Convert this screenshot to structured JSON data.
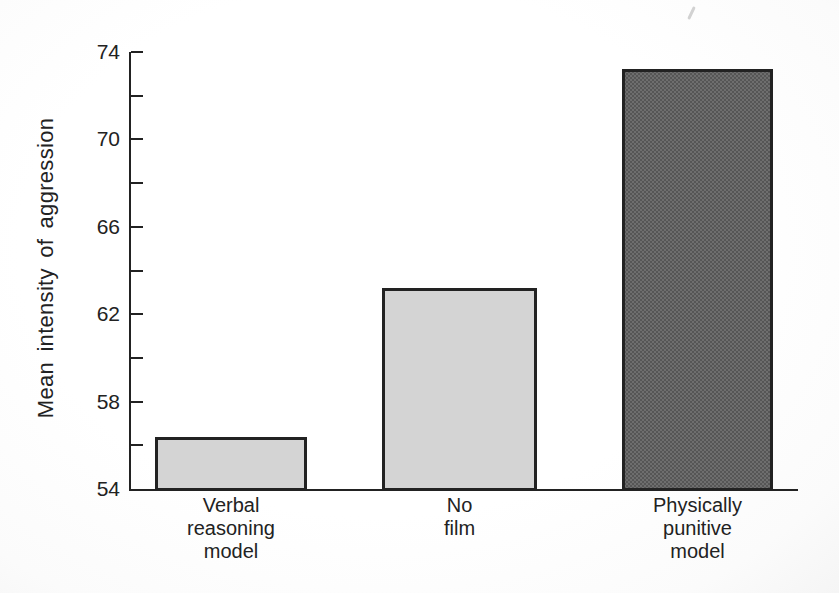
{
  "chart_data": {
    "type": "bar",
    "title": "",
    "xlabel": "",
    "ylabel": "Mean intensity of aggression",
    "categories": [
      "Verbal reasoning model",
      "No film",
      "Physically punitive model"
    ],
    "category_display_lines": [
      [
        "Verbal",
        "reasoning",
        "model"
      ],
      [
        "No",
        "film"
      ],
      [
        "Physically",
        "punitive",
        "model"
      ]
    ],
    "values": [
      56.4,
      63.2,
      73.2
    ],
    "bar_tones": [
      "light",
      "light",
      "dark"
    ],
    "ylim": [
      54,
      74
    ],
    "yticks_labeled": [
      74,
      70,
      66,
      62,
      58,
      54
    ],
    "yticks_minor": [
      72,
      68,
      64,
      60,
      56
    ],
    "grid": false,
    "legend": "none"
  },
  "colors": {
    "ink": "#222222",
    "light_bar_fill": "#d4d4d4",
    "light_bar_dot": "#ababab",
    "dark_bar_fill": "#6e6e6e",
    "dark_bar_dot": "#3e3e3e"
  }
}
